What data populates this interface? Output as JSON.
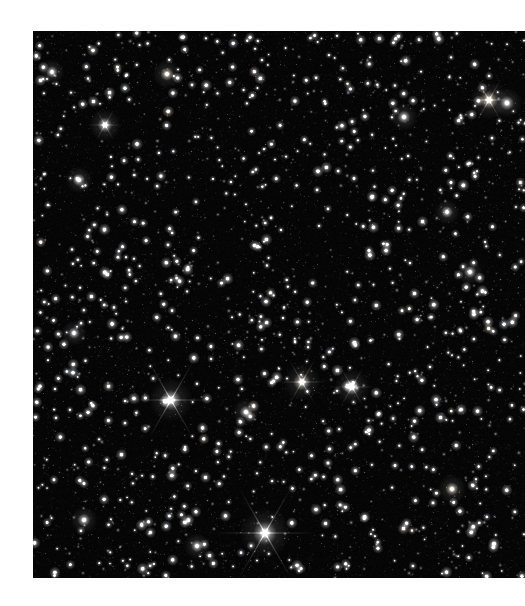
{
  "page": {
    "background_color": "#ffffff",
    "width": 525,
    "height": 606,
    "caption": ""
  },
  "image": {
    "title": "Dense star field",
    "alt_text": "Astronomical photograph of a dense field of stars against black sky",
    "subject": "starfield",
    "frame": {
      "x": 33,
      "y": 31,
      "width": 492,
      "height": 547
    },
    "sky_color": "#050506",
    "star_color": "#ffffff",
    "star_warm_tint": "#fff4e2",
    "star_cool_tint": "#e6eeff",
    "star_count": 2600,
    "noise_opacity": 0.1,
    "bright_stars": [
      {
        "name": "bright-star-lower-left",
        "x": 171,
        "y": 400,
        "radius": 5.2,
        "spikes": true,
        "spike_length": 44,
        "tint": "#ffffff"
      },
      {
        "name": "bright-star-bottom",
        "x": 265,
        "y": 533,
        "radius": 6.0,
        "spikes": true,
        "spike_length": 52,
        "tint": "#ffffff"
      },
      {
        "name": "bright-star-center",
        "x": 302,
        "y": 382,
        "radius": 4.4,
        "spikes": true,
        "spike_length": 26,
        "tint": "#fff6ea"
      },
      {
        "name": "bright-star-center-right",
        "x": 352,
        "y": 387,
        "radius": 4.2,
        "spikes": true,
        "spike_length": 22,
        "tint": "#ffffff"
      },
      {
        "name": "bright-star-upper-right",
        "x": 489,
        "y": 100,
        "radius": 4.6,
        "spikes": true,
        "spike_length": 24,
        "tint": "#fff2e0"
      },
      {
        "name": "bright-star-upper-right-b",
        "x": 507,
        "y": 103,
        "radius": 3.6,
        "spikes": false,
        "spike_length": 0,
        "tint": "#ffffff"
      },
      {
        "name": "bright-star-upper-left",
        "x": 105,
        "y": 125,
        "radius": 3.8,
        "spikes": true,
        "spike_length": 18,
        "tint": "#ffffff"
      },
      {
        "name": "bright-star-left-mid",
        "x": 79,
        "y": 180,
        "radius": 3.2,
        "spikes": false,
        "spike_length": 0,
        "tint": "#ffffff"
      },
      {
        "name": "bright-star-top-mid",
        "x": 167,
        "y": 74,
        "radius": 3.4,
        "spikes": false,
        "spike_length": 0,
        "tint": "#fff4e2"
      },
      {
        "name": "bright-star-top-right",
        "x": 404,
        "y": 117,
        "radius": 3.3,
        "spikes": false,
        "spike_length": 0,
        "tint": "#ffffff"
      },
      {
        "name": "bright-star-mid-right",
        "x": 470,
        "y": 272,
        "radius": 3.1,
        "spikes": false,
        "spike_length": 0,
        "tint": "#ffffff"
      },
      {
        "name": "bright-star-lower-right",
        "x": 452,
        "y": 489,
        "radius": 3.4,
        "spikes": false,
        "spike_length": 0,
        "tint": "#fff4e2"
      },
      {
        "name": "bright-star-mid-left",
        "x": 74,
        "y": 333,
        "radius": 3.0,
        "spikes": false,
        "spike_length": 0,
        "tint": "#ffffff"
      },
      {
        "name": "bright-star-bottom-left",
        "x": 84,
        "y": 520,
        "radius": 3.2,
        "spikes": false,
        "spike_length": 0,
        "tint": "#ffffff"
      },
      {
        "name": "bright-star-top-left-2",
        "x": 52,
        "y": 72,
        "radius": 3.0,
        "spikes": false,
        "spike_length": 0,
        "tint": "#ffffff"
      },
      {
        "name": "bright-star-center-low",
        "x": 246,
        "y": 412,
        "radius": 3.2,
        "spikes": false,
        "spike_length": 0,
        "tint": "#ffffff"
      },
      {
        "name": "bright-star-right-high",
        "x": 447,
        "y": 212,
        "radius": 3.0,
        "spikes": false,
        "spike_length": 0,
        "tint": "#ffffff"
      },
      {
        "name": "bright-star-bottom-mid",
        "x": 197,
        "y": 546,
        "radius": 3.1,
        "spikes": false,
        "spike_length": 0,
        "tint": "#ffffff"
      }
    ]
  }
}
